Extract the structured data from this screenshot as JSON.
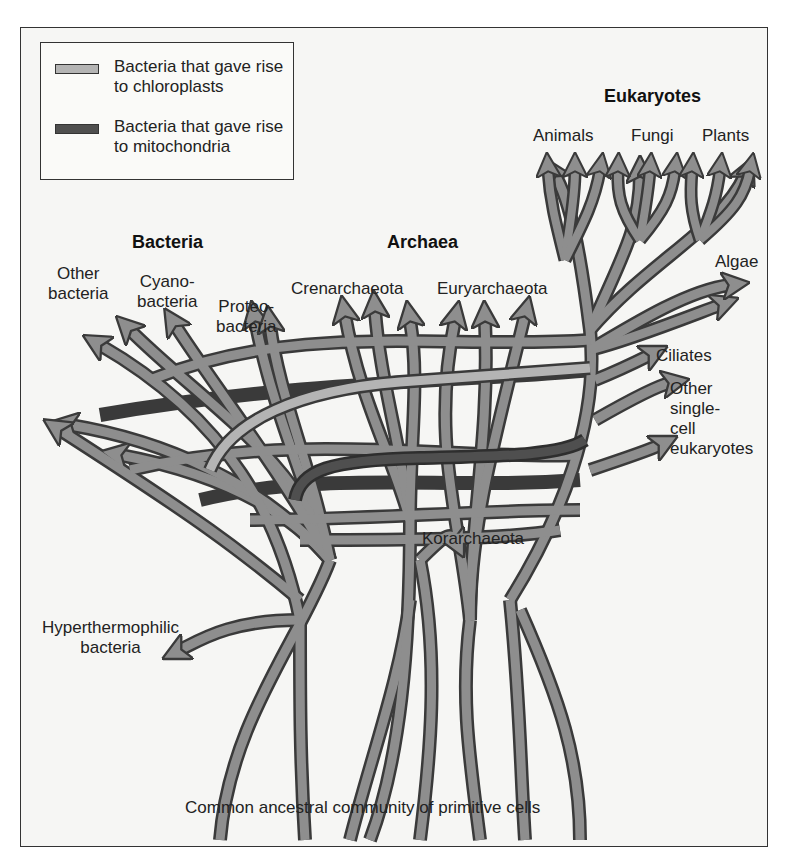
{
  "figure": {
    "colors": {
      "branch_fill": "#8e8e8e",
      "branch_outline": "#3a3a3a",
      "chloroplast_branch": "#b4b4b4",
      "mitochondria_branch": "#4f4f4f",
      "background": "#f6f6f4"
    },
    "legend": {
      "items": [
        {
          "label": "Bacteria that gave rise to chloroplasts",
          "color": "#b4b4b4"
        },
        {
          "label": "Bacteria that gave rise to mitochondria",
          "color": "#4f4f4f"
        }
      ]
    },
    "groups": {
      "bacteria": "Bacteria",
      "archaea": "Archaea",
      "eukaryotes": "Eukaryotes"
    },
    "labels": {
      "other_bacteria": [
        "Other",
        "bacteria"
      ],
      "cyanobacteria": [
        "Cyano-",
        "bacteria"
      ],
      "proteobacteria": [
        "Proteo-",
        "bacteria"
      ],
      "crenarchaeota": "Crenarchaeota",
      "euryarchaeota": "Euryarchaeota",
      "animals": "Animals",
      "fungi": "Fungi",
      "plants": "Plants",
      "algae": "Algae",
      "ciliates": "Ciliates",
      "other_single_cell": [
        "Other",
        "single-",
        "cell",
        "eukaryotes"
      ],
      "korarchaeota": "Korarchaeota",
      "hyperthermophilic": [
        "Hyperthermophilic",
        "bacteria"
      ],
      "root": "Common ancestral community of primitive cells"
    }
  }
}
